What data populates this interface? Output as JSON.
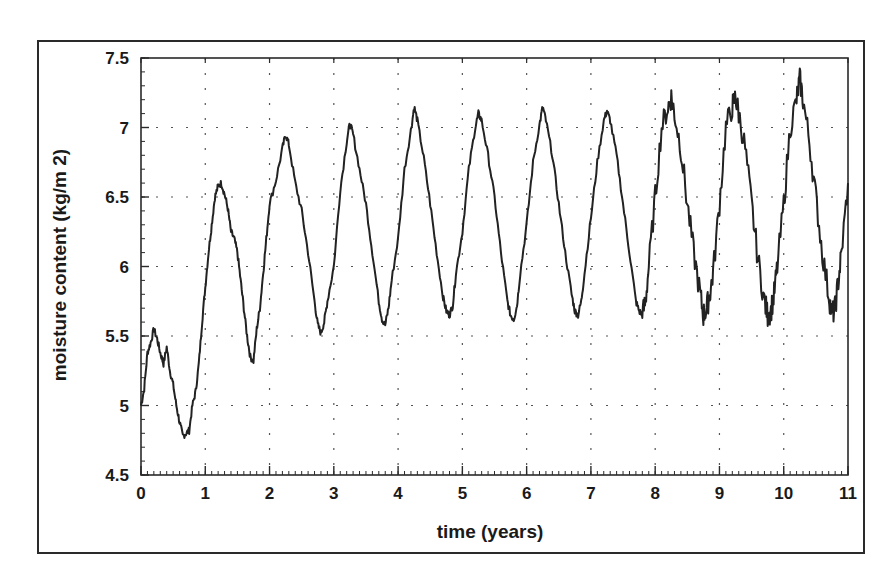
{
  "chart_data": {
    "type": "line",
    "title": "",
    "xlabel": "time (years)",
    "ylabel": "moisture content (kg/m 2)",
    "xlim": [
      0,
      11
    ],
    "ylim": [
      4.5,
      7.5
    ],
    "xticks": [
      "0",
      "1",
      "2",
      "3",
      "4",
      "5",
      "6",
      "7",
      "8",
      "9",
      "10",
      "11"
    ],
    "yticks": [
      "4.5",
      "5",
      "5.5",
      "6",
      "6.5",
      "7",
      "7.5"
    ],
    "grid": true,
    "grid_style": "dotted",
    "legend": null,
    "series": [
      {
        "name": "moisture content",
        "color": "#222222",
        "x": [
          0.0,
          0.05,
          0.1,
          0.15,
          0.2,
          0.25,
          0.3,
          0.35,
          0.4,
          0.45,
          0.5,
          0.55,
          0.6,
          0.65,
          0.7,
          0.75,
          0.8,
          0.85,
          0.9,
          0.95,
          1.0,
          1.05,
          1.1,
          1.15,
          1.2,
          1.25,
          1.3,
          1.35,
          1.4,
          1.45,
          1.5,
          1.55,
          1.6,
          1.65,
          1.7,
          1.75,
          1.8,
          1.85,
          1.9,
          1.95,
          2.0,
          2.1,
          2.2,
          2.25,
          2.3,
          2.4,
          2.5,
          2.6,
          2.7,
          2.75,
          2.8,
          2.85,
          2.9,
          3.0,
          3.1,
          3.2,
          3.25,
          3.3,
          3.4,
          3.5,
          3.6,
          3.7,
          3.75,
          3.8,
          3.85,
          3.9,
          4.0,
          4.1,
          4.2,
          4.25,
          4.3,
          4.4,
          4.5,
          4.6,
          4.7,
          4.75,
          4.8,
          4.85,
          4.9,
          5.0,
          5.1,
          5.2,
          5.25,
          5.3,
          5.4,
          5.5,
          5.6,
          5.7,
          5.75,
          5.8,
          5.85,
          5.9,
          6.0,
          6.1,
          6.2,
          6.25,
          6.3,
          6.4,
          6.5,
          6.6,
          6.7,
          6.75,
          6.8,
          6.85,
          6.9,
          7.0,
          7.1,
          7.2,
          7.25,
          7.3,
          7.4,
          7.5,
          7.6,
          7.7,
          7.75,
          7.8,
          7.85,
          7.9,
          8.0,
          8.1,
          8.2,
          8.25,
          8.3,
          8.4,
          8.5,
          8.6,
          8.7,
          8.75,
          8.8,
          8.85,
          8.9,
          9.0,
          9.1,
          9.2,
          9.25,
          9.3,
          9.4,
          9.5,
          9.6,
          9.7,
          9.75,
          9.8,
          9.85,
          9.9,
          10.0,
          10.1,
          10.2,
          10.25,
          10.3,
          10.4,
          10.5,
          10.6,
          10.7,
          10.75,
          10.8,
          10.85,
          10.9,
          11.0
        ],
        "y": [
          5.0,
          5.12,
          5.38,
          5.45,
          5.55,
          5.48,
          5.38,
          5.3,
          5.42,
          5.25,
          5.15,
          5.0,
          4.88,
          4.78,
          4.8,
          4.82,
          5.0,
          5.1,
          5.3,
          5.6,
          5.85,
          6.1,
          6.3,
          6.5,
          6.58,
          6.6,
          6.52,
          6.42,
          6.25,
          6.2,
          6.1,
          5.9,
          5.7,
          5.5,
          5.35,
          5.32,
          5.55,
          5.7,
          5.95,
          6.2,
          6.45,
          6.62,
          6.85,
          6.95,
          6.88,
          6.6,
          6.4,
          6.1,
          5.75,
          5.58,
          5.52,
          5.6,
          5.75,
          6.0,
          6.55,
          6.9,
          7.03,
          6.95,
          6.7,
          6.45,
          6.1,
          5.75,
          5.62,
          5.58,
          5.7,
          5.9,
          6.2,
          6.7,
          6.98,
          7.15,
          7.05,
          6.78,
          6.45,
          6.1,
          5.78,
          5.68,
          5.65,
          5.72,
          5.95,
          6.25,
          6.7,
          7.0,
          7.1,
          7.05,
          6.8,
          6.5,
          6.1,
          5.75,
          5.65,
          5.62,
          5.72,
          5.95,
          6.3,
          6.75,
          7.02,
          7.15,
          7.05,
          6.8,
          6.45,
          6.1,
          5.8,
          5.68,
          5.65,
          5.75,
          5.95,
          6.35,
          6.75,
          7.05,
          7.12,
          7.05,
          6.8,
          6.45,
          6.1,
          5.75,
          5.68,
          5.65,
          5.75,
          6.0,
          6.5,
          7.0,
          7.15,
          7.22,
          7.1,
          6.85,
          6.45,
          6.1,
          5.8,
          5.65,
          5.7,
          5.8,
          5.95,
          6.45,
          7.0,
          7.15,
          7.22,
          7.1,
          6.85,
          6.45,
          6.05,
          5.75,
          5.65,
          5.68,
          5.8,
          6.0,
          6.45,
          7.0,
          7.2,
          7.35,
          7.2,
          6.9,
          6.5,
          6.1,
          5.8,
          5.65,
          5.7,
          5.9,
          6.1,
          6.6
        ]
      }
    ],
    "annotations": []
  }
}
